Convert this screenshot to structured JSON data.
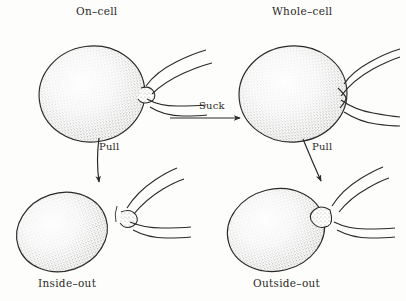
{
  "figure": {
    "kind": "patch-clamp-configurations-diagram",
    "background_color": "#fdfdfb",
    "ink_color": "#2b2a28",
    "panels": [
      {
        "id": "on-cell",
        "label": "On–cell",
        "label_position": "above",
        "description": "Intact cell with pipette sealed onto membrane surface"
      },
      {
        "id": "whole-cell",
        "label": "Whole–cell",
        "label_position": "above",
        "description": "Intact cell with ruptured patch, pipette interior continuous with cytoplasm"
      },
      {
        "id": "inside-out",
        "label": "Inside–out",
        "label_position": "below",
        "description": "Excised membrane patch on pipette tip, cell detached"
      },
      {
        "id": "outside-out",
        "label": "Outside–out",
        "label_position": "below",
        "description": "Excised resealed vesicle on pipette tip, cell detached"
      }
    ],
    "transitions": [
      {
        "id": "suck",
        "label": "Suck",
        "direction": "right",
        "from": "on-cell",
        "to": "whole-cell"
      },
      {
        "id": "pull-left",
        "label": "Pull",
        "direction": "down",
        "from": "on-cell",
        "to": "inside-out"
      },
      {
        "id": "pull-right",
        "label": "Pull",
        "direction": "down",
        "from": "whole-cell",
        "to": "outside-out"
      }
    ]
  }
}
